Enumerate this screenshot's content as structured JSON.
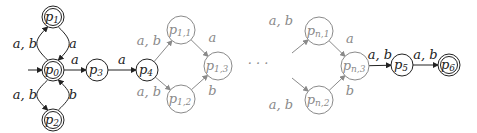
{
  "diagram": {
    "type": "finite-automaton",
    "colors": {
      "dark": "#222222",
      "light": "#8a8a8a"
    },
    "nodes": [
      {
        "id": "p0",
        "base": "p",
        "sub": "0",
        "x": 53,
        "y": 70,
        "r": 11,
        "accepting": true,
        "initial": true,
        "faded": false
      },
      {
        "id": "p1",
        "base": "p",
        "sub": "1",
        "x": 53,
        "y": 17,
        "r": 11,
        "accepting": true,
        "faded": false
      },
      {
        "id": "p2",
        "base": "p",
        "sub": "2",
        "x": 53,
        "y": 120,
        "r": 11,
        "accepting": true,
        "faded": false
      },
      {
        "id": "p3",
        "base": "p",
        "sub": "3",
        "x": 97,
        "y": 70,
        "r": 11,
        "accepting": false,
        "faded": false
      },
      {
        "id": "p4",
        "base": "p",
        "sub": "4",
        "x": 147,
        "y": 70,
        "r": 11,
        "accepting": false,
        "faded": false
      },
      {
        "id": "p11",
        "base": "p",
        "sub": "1,1",
        "x": 181,
        "y": 30,
        "r": 14,
        "accepting": false,
        "faded": true
      },
      {
        "id": "p12",
        "base": "p",
        "sub": "1,2",
        "x": 181,
        "y": 99,
        "r": 14,
        "accepting": false,
        "faded": true
      },
      {
        "id": "p13",
        "base": "p",
        "sub": "1,3",
        "x": 218,
        "y": 66,
        "r": 14,
        "accepting": false,
        "faded": true
      },
      {
        "id": "pn1",
        "base": "p",
        "sub": "n,1",
        "x": 319,
        "y": 31,
        "r": 14,
        "accepting": false,
        "faded": true
      },
      {
        "id": "pn2",
        "base": "p",
        "sub": "n,2",
        "x": 319,
        "y": 100,
        "r": 14,
        "accepting": false,
        "faded": true
      },
      {
        "id": "pn3",
        "base": "p",
        "sub": "n,3",
        "x": 355,
        "y": 66,
        "r": 14,
        "accepting": false,
        "faded": true
      },
      {
        "id": "p5",
        "base": "p",
        "sub": "5",
        "x": 402,
        "y": 65,
        "r": 11,
        "accepting": false,
        "faded": false
      },
      {
        "id": "p6",
        "base": "p",
        "sub": "6",
        "x": 449,
        "y": 65,
        "r": 11,
        "accepting": true,
        "faded": false
      }
    ],
    "edges": [
      {
        "from": "p0",
        "to": "p1",
        "label": "a, b",
        "curve": "left",
        "faded": false
      },
      {
        "from": "p1",
        "to": "p0",
        "label": "a",
        "curve": "right",
        "faded": false
      },
      {
        "from": "p2",
        "to": "p0",
        "label": "b",
        "curve": "right",
        "faded": false
      },
      {
        "from": "p0",
        "to": "p2",
        "label": "a, b",
        "curve": "left",
        "faded": false
      },
      {
        "from": "p0",
        "to": "p3",
        "label": "a",
        "faded": false
      },
      {
        "from": "p3",
        "to": "p4",
        "label": "a",
        "faded": false
      },
      {
        "from": "p4",
        "to": "p11",
        "label": "a, b",
        "faded": true
      },
      {
        "from": "p4",
        "to": "p12",
        "label": "a, b",
        "faded": true
      },
      {
        "from": "p11",
        "to": "p13",
        "label": "a",
        "faded": true
      },
      {
        "from": "p12",
        "to": "p13",
        "label": "b",
        "faded": true
      },
      {
        "from": null,
        "to": "pn1",
        "label": "a, b",
        "faded": true
      },
      {
        "from": null,
        "to": "pn2",
        "label": "a, b",
        "faded": true
      },
      {
        "from": "pn1",
        "to": "pn3",
        "label": "a",
        "faded": true
      },
      {
        "from": "pn2",
        "to": "pn3",
        "label": "b",
        "faded": true
      },
      {
        "from": "pn3",
        "to": "p5",
        "label": "a, b",
        "faded": false
      },
      {
        "from": "p5",
        "to": "p6",
        "label": "a, b",
        "faded": false
      }
    ],
    "ellipsis": "· · ·"
  }
}
